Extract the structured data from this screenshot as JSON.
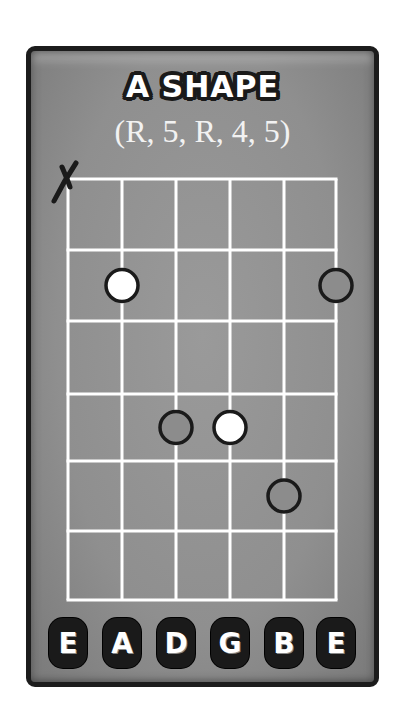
{
  "diagram": {
    "title": "A SHAPE",
    "subtitle": "(R, 5, R, 4, 5)",
    "colors": {
      "card_background": "#909090",
      "card_border": "#1c1c1c",
      "grid_lines": "#ffffff",
      "root_dot_fill": "#ffffff",
      "interval_dot_fill": "#8c8c8c",
      "dot_outline": "#1a1a1a"
    },
    "fretboard": {
      "strings": [
        "E",
        "A",
        "D",
        "G",
        "B",
        "E"
      ],
      "fret_count": 6,
      "muted_strings": [
        {
          "string": "E",
          "string_index": 0,
          "symbol": "X"
        }
      ],
      "notes": [
        {
          "string": "A",
          "string_index": 1,
          "fret": 2,
          "degree": "R",
          "style": "root-filled"
        },
        {
          "string": "E",
          "string_index": 5,
          "fret": 2,
          "degree": "5",
          "style": "hollow"
        },
        {
          "string": "D",
          "string_index": 2,
          "fret": 4,
          "degree": "5",
          "style": "hollow"
        },
        {
          "string": "G",
          "string_index": 3,
          "fret": 4,
          "degree": "R",
          "style": "root-filled"
        },
        {
          "string": "B",
          "string_index": 4,
          "fret": 5,
          "degree": "4",
          "style": "hollow"
        }
      ]
    }
  }
}
